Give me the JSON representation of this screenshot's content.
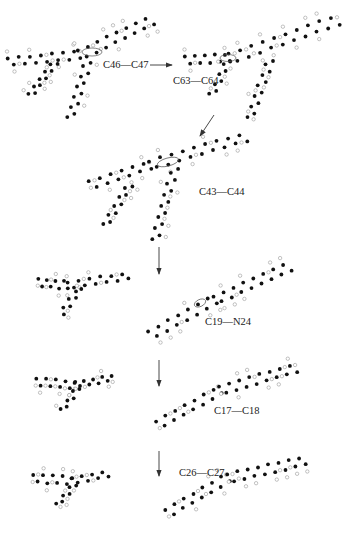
{
  "diagram": {
    "type": "molecular-fragmentation-pathway",
    "colors": {
      "carbon_atom": "#111111",
      "hydrogen_atom_stroke": "#999999",
      "hydrogen_atom_fill": "#ffffff",
      "arrow": "#333333",
      "bond_marker": "#555555"
    },
    "steps": [
      {
        "id": "step1",
        "label": "C46—C47",
        "arrow": "right"
      },
      {
        "id": "step2",
        "label": "C63—C64",
        "arrow": "down-left"
      },
      {
        "id": "step3",
        "label": "C43—C44",
        "arrow": "down"
      },
      {
        "id": "step4",
        "label": "C19—N24",
        "arrow": "down"
      },
      {
        "id": "step5",
        "label": "C17—C18",
        "arrow": "down"
      },
      {
        "id": "step6",
        "label": "C26—C27",
        "arrow": "none"
      }
    ],
    "icons": {
      "molecule": "ball-model-molecule",
      "arrow": "reaction-arrow",
      "bond_highlight": "ellipse-bond-marker"
    }
  }
}
